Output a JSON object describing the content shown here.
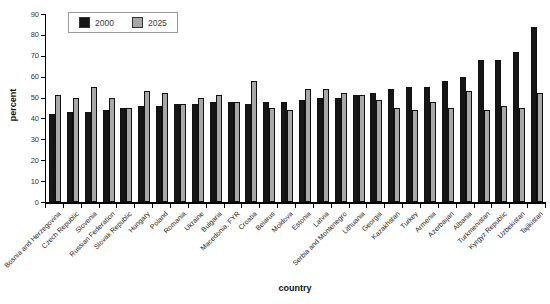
{
  "axes": {
    "x_title": "country",
    "y_title": "percent"
  },
  "chart_data": {
    "type": "bar",
    "title": "",
    "xlabel": "country",
    "ylabel": "percent",
    "ylim": [
      0,
      90
    ],
    "yticks": [
      0,
      10,
      20,
      30,
      40,
      50,
      60,
      70,
      80,
      90
    ],
    "grid": false,
    "legend_position": "top-left",
    "categories": [
      "Bosnia and Herzegovina",
      "Czech Republic",
      "Slovenia",
      "Russian Federation",
      "Slovak Republic",
      "Hungary",
      "Poland",
      "Romania",
      "Ukraine",
      "Bulgaria",
      "Macedonia, FYR",
      "Croatia",
      "Belarus",
      "Moldova",
      "Estonia",
      "Latvia",
      "Serbia and Montenegro",
      "Lithuania",
      "Georgia",
      "Kazakhstan",
      "Turkey",
      "Armenia",
      "Azerbaijan",
      "Albania",
      "Turkmenistan",
      "Kyrgyz Republic",
      "Uzbekistan",
      "Tajikistan"
    ],
    "series": [
      {
        "name": "2000",
        "color": "#161616",
        "values": [
          42,
          43,
          43,
          44,
          45,
          46,
          46,
          47,
          47,
          48,
          48,
          47,
          48,
          48,
          49,
          50,
          50,
          51,
          52,
          54,
          55,
          55,
          58,
          60,
          68,
          68,
          72,
          84
        ]
      },
      {
        "name": "2025",
        "color": "#a8a8a8",
        "values": [
          51,
          50,
          55,
          50,
          45,
          53,
          52,
          47,
          50,
          51,
          48,
          58,
          45,
          44,
          54,
          54,
          52,
          51,
          49,
          45,
          44,
          48,
          45,
          53,
          44,
          46,
          45,
          52
        ]
      }
    ]
  }
}
